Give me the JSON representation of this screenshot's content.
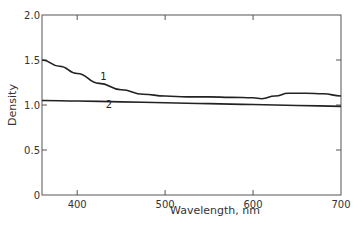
{
  "chart_data": {
    "type": "line",
    "title": "",
    "xlabel": "Wavelength, nm",
    "ylabel": "Density",
    "xlim": [
      360,
      700
    ],
    "ylim": [
      0,
      2.0
    ],
    "x_ticks": [
      400,
      500,
      600,
      700
    ],
    "x_tick_labels": [
      "400",
      "500",
      "600",
      "700"
    ],
    "y_ticks": [
      0,
      0.5,
      1.0,
      1.5,
      2.0
    ],
    "y_tick_labels": [
      "0",
      "0.5",
      "1.0",
      "1.5",
      "2.0"
    ],
    "grid": false,
    "legend": "none (curves labeled inline)",
    "series": [
      {
        "name": "1",
        "x": [
          360,
          380,
          400,
          425,
          450,
          475,
          500,
          525,
          550,
          575,
          600,
          610,
          625,
          640,
          660,
          680,
          700
        ],
        "values": [
          1.5,
          1.43,
          1.35,
          1.24,
          1.17,
          1.12,
          1.1,
          1.09,
          1.09,
          1.085,
          1.08,
          1.07,
          1.1,
          1.13,
          1.13,
          1.125,
          1.1
        ]
      },
      {
        "name": "2",
        "x": [
          360,
          400,
          450,
          500,
          550,
          600,
          650,
          700
        ],
        "values": [
          1.05,
          1.045,
          1.035,
          1.025,
          1.015,
          1.005,
          0.995,
          0.985
        ]
      }
    ],
    "annotations": [
      {
        "text": "1",
        "x": 430,
        "y": 1.28
      },
      {
        "text": "2",
        "x": 436,
        "y": 0.97
      }
    ]
  }
}
